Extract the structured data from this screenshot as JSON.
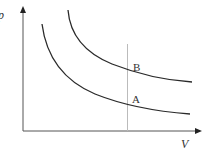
{
  "diagram": {
    "type": "p-V diagram",
    "axes": {
      "y_label": "p",
      "x_label": "V"
    },
    "curves": [
      {
        "name": "A",
        "label": "A",
        "description": "lower hyperbolic curve"
      },
      {
        "name": "B",
        "label": "B",
        "description": "upper hyperbolic curve"
      }
    ],
    "vertical_line": {
      "description": "constant-V line intersecting both curves"
    },
    "colors": {
      "curve": "#2a2a2a",
      "axis": "#555555",
      "vertical_line": "#bbbbbb",
      "text": "#333333"
    }
  }
}
